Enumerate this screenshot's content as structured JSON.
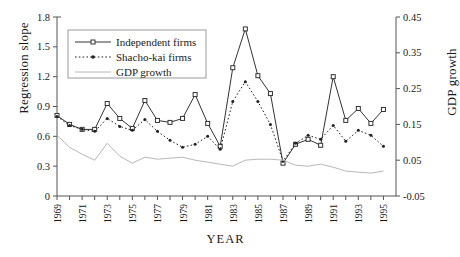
{
  "chart_data": {
    "type": "line",
    "title": "",
    "xlabel": "YEAR",
    "ylabel": "Regression slope",
    "ylabel_right": "GDP growth",
    "x": [
      1969,
      1970,
      1971,
      1972,
      1973,
      1974,
      1975,
      1976,
      1977,
      1978,
      1979,
      1980,
      1981,
      1982,
      1983,
      1984,
      1985,
      1986,
      1987,
      1988,
      1989,
      1990,
      1991,
      1992,
      1993,
      1994,
      1995
    ],
    "xtick_labels": [
      "1969",
      "1971",
      "1973",
      "1975",
      "1977",
      "1979",
      "1981",
      "1983",
      "1985",
      "1987",
      "1989",
      "1991",
      "1993",
      "1995"
    ],
    "xlim": [
      1969,
      1996
    ],
    "ylim": [
      0,
      1.8
    ],
    "yticks": [
      0,
      0.3,
      0.6,
      0.9,
      1.2,
      1.5,
      1.8
    ],
    "ytick_labels": [
      "0",
      "0.3",
      "0.6",
      "0.9",
      "1.2",
      "1.5",
      "1.8"
    ],
    "ylim_right": [
      -0.05,
      0.45
    ],
    "yticks_right": [
      -0.05,
      0.05,
      0.15,
      0.25,
      0.35,
      0.45
    ],
    "ytick_labels_right": [
      "-0.05",
      "0.05",
      "0.15",
      "0.25",
      "0.35",
      "0.45"
    ],
    "grid": false,
    "legend_position": "upper-left",
    "series": [
      {
        "name": "Independent firms",
        "axis": "left",
        "marker": "open-square",
        "linestyle": "solid",
        "color": "#333333",
        "values": [
          0.81,
          0.72,
          0.67,
          0.67,
          0.93,
          0.78,
          0.68,
          0.96,
          0.76,
          0.74,
          0.78,
          1.02,
          0.73,
          0.5,
          1.29,
          1.68,
          1.21,
          1.03,
          0.33,
          0.52,
          0.57,
          0.51,
          1.2,
          0.76,
          0.88,
          0.73,
          0.87
        ]
      },
      {
        "name": "Shacho-kai firms",
        "axis": "left",
        "marker": "filled-dot",
        "linestyle": "dotted",
        "color": "#222222",
        "values": [
          0.8,
          0.71,
          0.67,
          0.65,
          0.78,
          0.7,
          0.66,
          0.77,
          0.65,
          0.56,
          0.49,
          0.52,
          0.6,
          0.47,
          0.95,
          1.15,
          0.95,
          0.72,
          0.35,
          0.53,
          0.61,
          0.57,
          0.71,
          0.55,
          0.66,
          0.61,
          0.5
        ]
      },
      {
        "name": "GDP growth",
        "axis": "right",
        "marker": "none",
        "linestyle": "solid-light",
        "color": "#b8b8b8",
        "values_left_scale": [
          0.61,
          0.49,
          0.42,
          0.36,
          0.53,
          0.4,
          0.33,
          0.39,
          0.37,
          0.38,
          0.39,
          0.36,
          0.34,
          0.32,
          0.3,
          0.36,
          0.37,
          0.37,
          0.36,
          0.31,
          0.3,
          0.32,
          0.29,
          0.25,
          0.24,
          0.23,
          0.25
        ],
        "values": [
          0.1194,
          0.0833,
          0.0633,
          0.0467,
          0.0939,
          0.0672,
          0.0483,
          0.065,
          0.0583,
          0.0611,
          0.0639,
          0.055,
          0.0494,
          0.0439,
          0.0383,
          0.055,
          0.0583,
          0.0583,
          0.055,
          0.0361,
          0.0333,
          0.0389,
          0.0306,
          0.0194,
          0.0167,
          0.0139,
          0.0194
        ]
      }
    ]
  },
  "legend": {
    "items": [
      {
        "label": "Independent firms"
      },
      {
        "label": "Shacho-kai firms"
      },
      {
        "label": "GDP growth"
      }
    ]
  }
}
